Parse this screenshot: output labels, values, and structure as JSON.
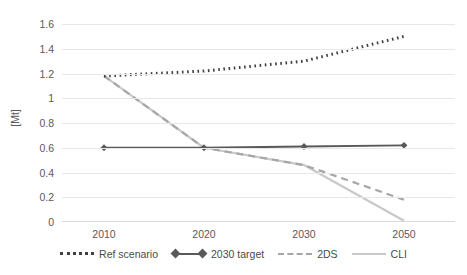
{
  "chart_data": {
    "type": "line",
    "title": "",
    "xlabel": "",
    "ylabel": "[Mt]",
    "categories": [
      "2010",
      "2020",
      "2030",
      "2050"
    ],
    "x": [
      2010,
      2020,
      2030,
      2050
    ],
    "ylim": [
      0,
      1.6
    ],
    "yticks": [
      0,
      0.2,
      0.4,
      0.6,
      0.8,
      1,
      1.2,
      1.4,
      1.6
    ],
    "ytick_labels": [
      "0",
      "0.2",
      "0.4",
      "0.6",
      "0.8",
      "1",
      "1.2",
      "1.4",
      "1.6"
    ],
    "grid": true,
    "legend_position": "bottom",
    "series": [
      {
        "name": "Ref scenario",
        "values": [
          1.18,
          1.22,
          1.3,
          1.5
        ],
        "style": "dotted",
        "color": "#404040",
        "marker": "none"
      },
      {
        "name": "2030 target",
        "values": [
          0.6,
          0.6,
          0.61,
          0.62
        ],
        "style": "solid",
        "color": "#595959",
        "marker": "diamond"
      },
      {
        "name": "2DS",
        "values": [
          1.18,
          0.6,
          0.46,
          0.18
        ],
        "style": "dashed",
        "color": "#a6a6a6",
        "marker": "none"
      },
      {
        "name": "CLI",
        "values": [
          1.18,
          0.6,
          0.46,
          0.01
        ],
        "style": "solid",
        "color": "#c9c9c9",
        "marker": "none"
      }
    ]
  },
  "axes": {
    "y_title": "[Mt]",
    "y_labels": [
      "1.6",
      "1.4",
      "1.2",
      "1",
      "0.8",
      "0.6",
      "0.4",
      "0.2",
      "0"
    ],
    "x_labels": [
      "2010",
      "2020",
      "2030",
      "2050"
    ]
  },
  "legend": {
    "items": [
      {
        "label": "Ref scenario",
        "style": "dotted",
        "color": "#404040"
      },
      {
        "label": "2030 target",
        "style": "solid-marker",
        "color": "#595959"
      },
      {
        "label": "2DS",
        "style": "dashed",
        "color": "#a6a6a6"
      },
      {
        "label": "CLI",
        "style": "solid",
        "color": "#c9c9c9"
      }
    ]
  },
  "colors": {
    "grid": "#e8e8e8",
    "axis": "#d9d9d9",
    "text": "#5a5a5a",
    "ref_scenario": "#404040",
    "target_2030": "#595959",
    "two_ds": "#a6a6a6",
    "cli": "#c9c9c9"
  }
}
